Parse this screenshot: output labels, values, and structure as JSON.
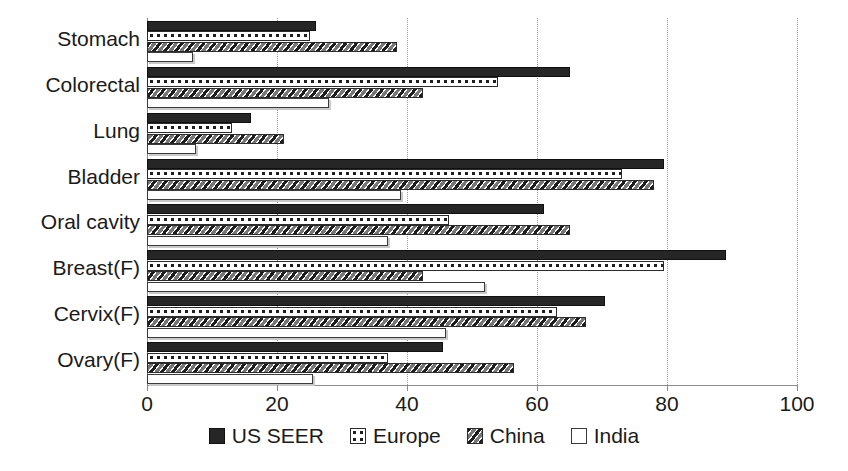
{
  "chart_data": {
    "type": "bar",
    "orientation": "horizontal",
    "title": "",
    "xlabel": "",
    "ylabel": "",
    "xlim": [
      0,
      100
    ],
    "xticks": [
      0,
      20,
      40,
      60,
      80,
      100
    ],
    "grid": true,
    "legend_position": "bottom",
    "categories": [
      "Stomach",
      "Colorectal",
      "Lung",
      "Bladder",
      "Oral cavity",
      "Breast(F)",
      "Cervix(F)",
      "Ovary(F)"
    ],
    "series": [
      {
        "name": "US SEER",
        "pattern": "solid-black",
        "color": "#262626",
        "values": [
          26,
          65,
          16,
          79.5,
          61,
          89,
          70.5,
          45.5
        ]
      },
      {
        "name": "Europe",
        "pattern": "dotted-circles",
        "color": "#ffffff",
        "values": [
          25,
          54,
          13,
          73,
          46.5,
          79.5,
          63,
          37
        ]
      },
      {
        "name": "China",
        "pattern": "diagonal-hatch",
        "color": "#777777",
        "values": [
          38.5,
          42.5,
          21,
          78,
          65,
          42.5,
          67.5,
          56.5
        ]
      },
      {
        "name": "India",
        "pattern": "open-white",
        "color": "#ffffff",
        "values": [
          7,
          28,
          7.5,
          39,
          37,
          52,
          46,
          25.5
        ]
      }
    ]
  },
  "axis": {
    "tick_labels": [
      "0",
      "20",
      "40",
      "60",
      "80",
      "100"
    ]
  },
  "legend": {
    "items": [
      {
        "label": "US SEER",
        "swatch": "solid-black-swatch"
      },
      {
        "label": "Europe",
        "swatch": "dotted-circles-swatch"
      },
      {
        "label": "China",
        "swatch": "diagonal-hatch-swatch"
      },
      {
        "label": "India",
        "swatch": "open-white-swatch"
      }
    ]
  }
}
